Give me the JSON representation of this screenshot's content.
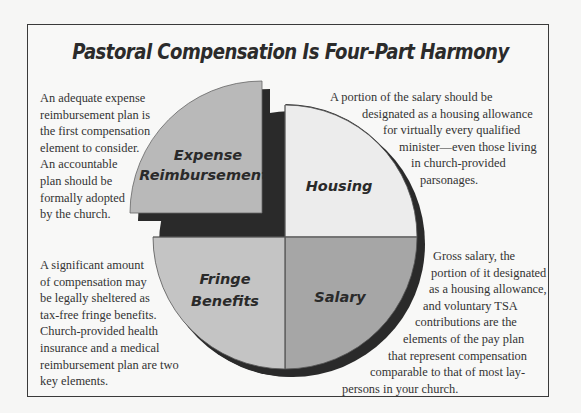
{
  "title": "Pastoral Compensation Is Four-Part Harmony",
  "colors": {
    "page_bg": "#f6f6f5",
    "frame_border": "#3a3a3a",
    "expense_fill": "#b9b9b9",
    "housing_fill": "#ececec",
    "fringe_fill": "#c4c4c4",
    "salary_fill": "#a6a6a6",
    "shadow": "#2a2a2a"
  },
  "slices": [
    {
      "id": "expense",
      "label_lines": [
        "Expense",
        "Reimbursements"
      ],
      "quadrant": "top-left",
      "exploded": true
    },
    {
      "id": "housing",
      "label_lines": [
        "Housing"
      ],
      "quadrant": "top-right",
      "exploded": false
    },
    {
      "id": "fringe",
      "label_lines": [
        "Fringe",
        "Benefits"
      ],
      "quadrant": "bottom-left",
      "exploded": false
    },
    {
      "id": "salary",
      "label_lines": [
        "Salary"
      ],
      "quadrant": "bottom-right",
      "exploded": false
    }
  ],
  "notes": {
    "expense": {
      "lines": [
        "An adequate expense",
        "reimbursement plan is",
        "the first compensation",
        "element to consider.",
        "An accountable",
        "plan should be",
        "formally adopted",
        "by the church."
      ]
    },
    "housing": {
      "lines": [
        "A portion of the salary should be",
        "designated as a housing allowance",
        "for virtually every qualified",
        "minister—even those living",
        "in church-provided",
        "parsonages."
      ]
    },
    "fringe": {
      "lines": [
        "A significant amount",
        "of compensation may",
        "be legally sheltered as",
        "tax-free fringe benefits.",
        "Church-provided health",
        "insurance and a medical",
        "reimbursement plan are two",
        "key elements."
      ]
    },
    "salary": {
      "lines": [
        "Gross salary, the",
        "portion of it designated",
        "as a housing allowance,",
        "and voluntary TSA",
        "contributions are the",
        "elements of the pay plan",
        "that represent compensation",
        "comparable to that of most lay-",
        "persons in your church."
      ]
    }
  }
}
